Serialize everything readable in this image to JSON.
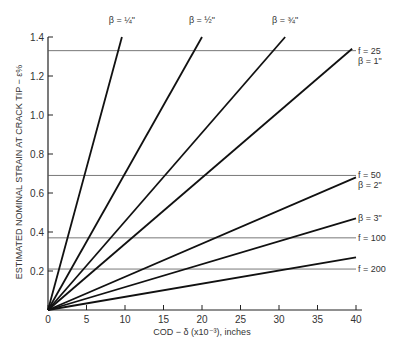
{
  "chart_data": {
    "type": "line",
    "title": "",
    "xlabel": "COD − δ (x10⁻³), inches",
    "ylabel": "ESTIMATED NOMINAL STRAIN AT CRACK TIP − ε%",
    "xlim": [
      0,
      40
    ],
    "ylim": [
      0,
      1.4
    ],
    "x_ticks": [
      0,
      5,
      10,
      15,
      20,
      25,
      30,
      35,
      40
    ],
    "y_ticks": [
      0.2,
      0.4,
      0.6,
      0.8,
      1.0,
      1.2,
      1.4
    ],
    "y_tick_labels": [
      "0.2",
      "0.4",
      "0.6",
      "0.8",
      "1.0",
      "1.2",
      "1.4"
    ],
    "x_tick_labels": [
      "0",
      "5",
      "10",
      "15",
      "20",
      "25",
      "30",
      "35",
      "40"
    ],
    "grid": false,
    "series": [
      {
        "name": "β = 1/4\"",
        "label": "β = ¼\"",
        "x": [
          0,
          9.6
        ],
        "y": [
          0,
          1.4
        ]
      },
      {
        "name": "β = 1/2\"",
        "label": "β = ½\"",
        "x": [
          0,
          20.0
        ],
        "y": [
          0,
          1.4
        ]
      },
      {
        "name": "β = 3/4\"",
        "label": "β = ¾\"",
        "x": [
          0,
          30.8
        ],
        "y": [
          0,
          1.4
        ]
      },
      {
        "name": "β = 1\"",
        "label": "β = 1\"",
        "x": [
          0,
          39.5
        ],
        "y": [
          0,
          1.34
        ]
      },
      {
        "name": "β = 2\"",
        "label": "β = 2\"",
        "x": [
          0,
          40
        ],
        "y": [
          0,
          0.68
        ]
      },
      {
        "name": "β = 3\"",
        "label": "β = 3\"",
        "x": [
          0,
          40
        ],
        "y": [
          0,
          0.47
        ]
      },
      {
        "name": "lowest (unlabeled)",
        "label": "",
        "x": [
          0,
          40
        ],
        "y": [
          0,
          0.27
        ]
      }
    ],
    "reference_lines": [
      {
        "label": "f = 25",
        "y": 1.33
      },
      {
        "label": "f = 50",
        "y": 0.69
      },
      {
        "label": "f = 100",
        "y": 0.37
      },
      {
        "label": "f = 200",
        "y": 0.21
      }
    ]
  }
}
